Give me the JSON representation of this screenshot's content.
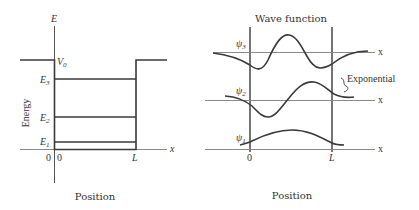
{
  "left_panel": {
    "y_axis_label": "E",
    "x_axis_label": "x",
    "side_label": "Energy",
    "caption": "Position",
    "potential_label": "V",
    "potential_sub": "0",
    "levels": [
      {
        "label": "E",
        "sub": "3"
      },
      {
        "label": "E",
        "sub": "2"
      },
      {
        "label": "E",
        "sub": "1"
      }
    ],
    "origin_energy": "0",
    "origin_x": "0",
    "well_width": "L"
  },
  "right_panel": {
    "title": "Wave function",
    "caption": "Position",
    "annotation": "Exponential",
    "x_axis_label": "x",
    "origin_x": "0",
    "well_width": "L",
    "wavefunctions": [
      {
        "label": "ψ",
        "sub": "3"
      },
      {
        "label": "ψ",
        "sub": "2"
      },
      {
        "label": "ψ",
        "sub": "1"
      }
    ]
  },
  "colors": {
    "curve": "#3a3a3a",
    "axis": "#8a8a8a",
    "text": "#333333"
  }
}
